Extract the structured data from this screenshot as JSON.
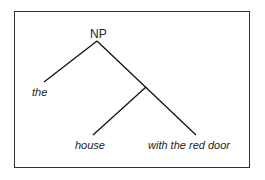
{
  "diagram": {
    "type": "syntax-tree",
    "root": {
      "label": "NP",
      "x": 97,
      "y": 33
    },
    "leaves": [
      {
        "id": "the",
        "text": "the",
        "x": 32,
        "y": 93
      },
      {
        "id": "house",
        "text": "house",
        "x": 75,
        "y": 146
      },
      {
        "id": "with-the-red-door",
        "text": "with the red door",
        "x": 148,
        "y": 146
      }
    ],
    "intermediate_node": {
      "x": 146,
      "y": 87
    },
    "edges": [
      {
        "from": [
          97,
          41
        ],
        "to": [
          44,
          82
        ]
      },
      {
        "from": [
          97,
          41
        ],
        "to": [
          196,
          135
        ]
      },
      {
        "from": [
          146,
          87
        ],
        "to": [
          93,
          135
        ]
      }
    ],
    "line_color": "#111111",
    "frame_color": "#333333"
  }
}
